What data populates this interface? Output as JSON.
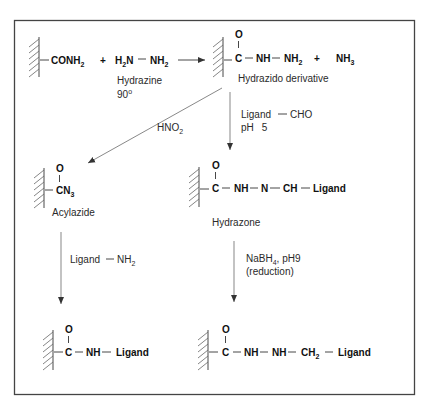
{
  "diagram": {
    "type": "reaction-scheme",
    "reactions": {
      "step1": {
        "reactant1": {
          "group": "CONH",
          "sub": "2"
        },
        "plus1": "+",
        "reactant2": {
          "left": "H",
          "left_sub": "2",
          "left_tail": "N",
          "right": "NH",
          "right_sub": "2"
        },
        "reagent_name": "Hydrazine",
        "temperature": "90",
        "temperature_unit": "o",
        "product": {
          "carbonyl_o": "O",
          "carbon": "C",
          "nh": "NH",
          "nh2": "NH",
          "nh2_sub": "2"
        },
        "plus2": "+",
        "byproduct": {
          "text": "NH",
          "sub": "3"
        },
        "product_name": "Hydrazido derivative"
      },
      "branch_left": {
        "reagent": {
          "text": "HNO",
          "sub": "2"
        },
        "product": {
          "carbonyl_o": "O",
          "group": "CN",
          "sub": "3"
        },
        "product_name": "Acylazide",
        "next_reagent": {
          "ligand": "Ligand",
          "group": "NH",
          "sub": "2"
        },
        "final_product": {
          "carbonyl_o": "O",
          "carbon": "C",
          "nh": "NH",
          "ligand": "Ligand"
        }
      },
      "branch_right": {
        "reagent": {
          "ligand": "Ligand",
          "group": "CHO",
          "ph_label": "pH",
          "ph_value": "5"
        },
        "product": {
          "carbonyl_o": "O",
          "carbon": "C",
          "nh": "NH",
          "n": "N",
          "ch": "CH",
          "ligand": "Ligand"
        },
        "product_name": "Hydrazone",
        "next_reagent": {
          "text": "NaBH",
          "sub": "4",
          "ph": ", pH9",
          "note": "(reduction)"
        },
        "final_product": {
          "carbonyl_o": "O",
          "carbon": "C",
          "nh1": "NH",
          "nh2": "NH",
          "ch2": "CH",
          "ch2_sub": "2",
          "ligand": "Ligand"
        }
      }
    },
    "colors": {
      "ink": "#2a2a2a",
      "frame": "#444444",
      "background": "#ffffff"
    }
  }
}
